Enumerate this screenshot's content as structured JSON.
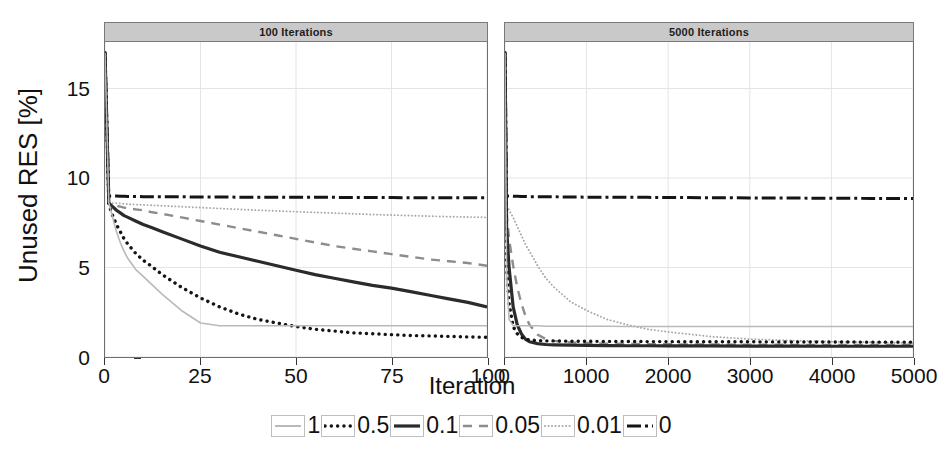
{
  "figure": {
    "ylabel": "Unused RES [%]",
    "xlabel": "Iteration"
  },
  "panels": [
    {
      "strip": "100 Iterations"
    },
    {
      "strip": "5000 Iterations"
    }
  ],
  "axes": {
    "y_ticks": [
      "0",
      "5",
      "10",
      "15"
    ],
    "x_ticks_left": [
      "0",
      "25",
      "50",
      "75",
      "100"
    ],
    "x_ticks_right": [
      "0",
      "1000",
      "2000",
      "3000",
      "4000",
      "5000"
    ]
  },
  "legend": {
    "entries": [
      {
        "label": "1",
        "style": "solid-light",
        "color": "#b9b9b9"
      },
      {
        "label": "0.5",
        "style": "dotted-bold",
        "color": "#111111"
      },
      {
        "label": "0.1",
        "style": "solid-dark",
        "color": "#2b2b2b"
      },
      {
        "label": "0.05",
        "style": "dashed",
        "color": "#8d8d8d"
      },
      {
        "label": "0.01",
        "style": "dotted-fine",
        "color": "#a8a8a8"
      },
      {
        "label": "0",
        "style": "dashdot",
        "color": "#111111"
      }
    ]
  },
  "chart_data": {
    "type": "line",
    "title": "",
    "xlabel": "Iteration",
    "ylabel": "Unused RES [%]",
    "ylim": [
      0,
      17.6
    ],
    "grid": true,
    "legend_position": "bottom",
    "legend_title": "",
    "facets": [
      {
        "name": "100 Iterations",
        "xlim": [
          0,
          100
        ],
        "xticks": [
          0,
          25,
          50,
          75,
          100
        ],
        "yticks": [
          0,
          5,
          10,
          15
        ],
        "x": [
          0,
          1,
          2,
          3,
          4,
          5,
          6,
          8,
          10,
          12,
          15,
          20,
          25,
          30,
          35,
          40,
          45,
          50,
          55,
          60,
          65,
          70,
          75,
          80,
          85,
          90,
          95,
          100
        ],
        "series": [
          {
            "name": "1",
            "values": [
              17.0,
              8.6,
              7.8,
              7.0,
              6.4,
              5.9,
              5.5,
              4.9,
              4.5,
              4.1,
              3.5,
              2.6,
              1.9,
              1.75,
              1.75,
              1.75,
              1.75,
              1.75,
              1.75,
              1.75,
              1.75,
              1.75,
              1.75,
              1.75,
              1.75,
              1.75,
              1.75,
              1.75
            ]
          },
          {
            "name": "0.5",
            "values": [
              17.0,
              8.5,
              7.9,
              7.4,
              7.0,
              6.6,
              6.3,
              5.8,
              5.4,
              5.1,
              4.6,
              3.9,
              3.3,
              2.8,
              2.4,
              2.1,
              1.9,
              1.7,
              1.55,
              1.45,
              1.35,
              1.3,
              1.25,
              1.2,
              1.18,
              1.15,
              1.12,
              1.1
            ]
          },
          {
            "name": "0.1",
            "values": [
              17.0,
              8.6,
              8.4,
              8.2,
              8.05,
              7.9,
              7.8,
              7.6,
              7.4,
              7.25,
              7.0,
              6.6,
              6.2,
              5.85,
              5.6,
              5.35,
              5.1,
              4.85,
              4.6,
              4.4,
              4.2,
              4.0,
              3.85,
              3.65,
              3.45,
              3.25,
              3.05,
              2.8
            ]
          },
          {
            "name": "0.05",
            "values": [
              17.0,
              8.6,
              8.5,
              8.45,
              8.4,
              8.35,
              8.3,
              8.25,
              8.2,
              8.1,
              8.0,
              7.8,
              7.6,
              7.4,
              7.2,
              7.0,
              6.8,
              6.6,
              6.4,
              6.2,
              6.05,
              5.9,
              5.75,
              5.6,
              5.45,
              5.35,
              5.25,
              5.1
            ]
          },
          {
            "name": "0.01",
            "values": [
              17.0,
              8.65,
              8.6,
              8.6,
              8.58,
              8.56,
              8.54,
              8.52,
              8.5,
              8.48,
              8.45,
              8.4,
              8.35,
              8.3,
              8.25,
              8.2,
              8.16,
              8.12,
              8.08,
              8.04,
              8.0,
              7.96,
              7.93,
              7.9,
              7.87,
              7.84,
              7.82,
              7.8
            ]
          },
          {
            "name": "0",
            "values": [
              17.0,
              9.0,
              9.0,
              9.0,
              8.98,
              8.98,
              8.97,
              8.97,
              8.96,
              8.96,
              8.95,
              8.95,
              8.94,
              8.94,
              8.93,
              8.93,
              8.93,
              8.92,
              8.92,
              8.92,
              8.91,
              8.91,
              8.91,
              8.9,
              8.9,
              8.9,
              8.9,
              8.9
            ]
          }
        ]
      },
      {
        "name": "5000 Iterations",
        "xlim": [
          0,
          5000
        ],
        "xticks": [
          0,
          1000,
          2000,
          3000,
          4000,
          5000
        ],
        "yticks": [
          0,
          5,
          10,
          15
        ],
        "x": [
          0,
          20,
          50,
          100,
          150,
          200,
          250,
          300,
          400,
          500,
          600,
          800,
          1000,
          1250,
          1500,
          1750,
          2000,
          2500,
          3000,
          3500,
          4000,
          4500,
          5000
        ],
        "series": [
          {
            "name": "1",
            "values": [
              17.0,
              4.6,
              2.1,
              1.75,
              1.75,
              1.75,
              1.75,
              1.75,
              1.75,
              1.72,
              1.72,
              1.72,
              1.72,
              1.72,
              1.7,
              1.7,
              1.7,
              1.7,
              1.7,
              1.7,
              1.7,
              1.7,
              1.7
            ]
          },
          {
            "name": "0.5",
            "values": [
              17.0,
              5.0,
              3.0,
              1.7,
              1.3,
              1.1,
              1.0,
              0.95,
              0.92,
              0.9,
              0.9,
              0.88,
              0.88,
              0.87,
              0.87,
              0.86,
              0.86,
              0.85,
              0.85,
              0.84,
              0.84,
              0.83,
              0.83
            ]
          },
          {
            "name": "0.1",
            "values": [
              17.0,
              7.2,
              5.0,
              2.8,
              1.8,
              1.3,
              1.0,
              0.85,
              0.75,
              0.7,
              0.68,
              0.66,
              0.65,
              0.64,
              0.63,
              0.63,
              0.62,
              0.62,
              0.61,
              0.61,
              0.6,
              0.6,
              0.6
            ]
          },
          {
            "name": "0.05",
            "values": [
              17.0,
              8.0,
              6.6,
              5.1,
              3.9,
              3.0,
              2.3,
              1.8,
              1.25,
              1.0,
              0.9,
              0.82,
              0.78,
              0.75,
              0.73,
              0.72,
              0.71,
              0.7,
              0.69,
              0.68,
              0.68,
              0.67,
              0.67
            ]
          },
          {
            "name": "0.01",
            "values": [
              17.0,
              8.5,
              8.2,
              7.8,
              7.3,
              6.8,
              6.3,
              5.9,
              5.1,
              4.4,
              3.9,
              3.1,
              2.6,
              2.1,
              1.8,
              1.55,
              1.4,
              1.15,
              1.0,
              0.92,
              0.86,
              0.82,
              0.78
            ]
          },
          {
            "name": "0",
            "values": [
              17.0,
              9.0,
              9.0,
              8.98,
              8.98,
              8.97,
              8.97,
              8.96,
              8.96,
              8.95,
              8.95,
              8.94,
              8.93,
              8.93,
              8.92,
              8.92,
              8.91,
              8.9,
              8.89,
              8.88,
              8.87,
              8.86,
              8.85
            ]
          }
        ]
      }
    ]
  }
}
